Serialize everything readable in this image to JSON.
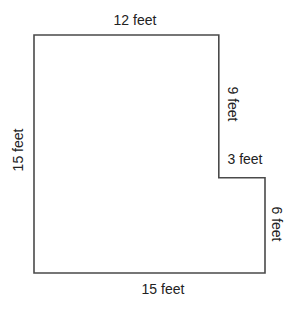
{
  "figure": {
    "type": "composite rectilinear floor plan (L-shape)",
    "units": "feet",
    "colors": {
      "background": "#ffffff",
      "outline": "#4a4a4a",
      "text": "#222222"
    },
    "shape_vertices_feet": [
      [
        0,
        0
      ],
      [
        12,
        0
      ],
      [
        12,
        9
      ],
      [
        15,
        9
      ],
      [
        15,
        15
      ],
      [
        0,
        15
      ]
    ],
    "labels": {
      "top": "12 feet",
      "right_upper": "9 feet",
      "step": "3 feet",
      "right_lower": "6 feet",
      "bottom": "15 feet",
      "left": "15 feet"
    },
    "edges": [
      {
        "side": "top",
        "length_ft": 12
      },
      {
        "side": "right-upper",
        "length_ft": 9
      },
      {
        "side": "step",
        "length_ft": 3
      },
      {
        "side": "right-lower",
        "length_ft": 6
      },
      {
        "side": "bottom",
        "length_ft": 15
      },
      {
        "side": "left",
        "length_ft": 15
      }
    ]
  }
}
